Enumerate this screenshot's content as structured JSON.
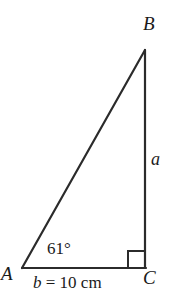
{
  "figure": {
    "kind": "right-triangle-diagram",
    "background_color": "#ffffff",
    "stroke_color": "#2b2b2b",
    "text_color": "#1a1a1a"
  },
  "vertices": {
    "a": {
      "label": "A",
      "x": 22,
      "y": 268
    },
    "b": {
      "label": "B",
      "x": 145,
      "y": 50
    },
    "c": {
      "label": "C",
      "x": 145,
      "y": 268
    }
  },
  "sides": {
    "a": {
      "label": "a",
      "from": "B",
      "to": "C",
      "orientation": "vertical"
    },
    "b": {
      "label": "b = 10 cm",
      "label_variable": "b",
      "label_rest": " = 10 cm",
      "value": 10,
      "unit": "cm",
      "from": "A",
      "to": "C",
      "orientation": "horizontal"
    }
  },
  "angles": {
    "at_a": {
      "label": "61°",
      "value": 61,
      "unit": "degrees"
    },
    "at_c": {
      "label": "",
      "value": 90,
      "unit": "degrees",
      "marker": "right-angle-square"
    }
  }
}
